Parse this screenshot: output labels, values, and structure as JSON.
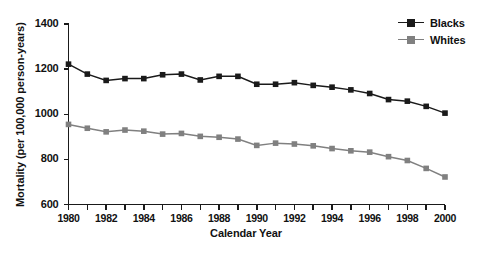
{
  "chart_data": {
    "type": "line",
    "title": "",
    "xlabel": "Calendar Year",
    "ylabel": "Mortality (per 100,000 person-years)",
    "x": [
      1980,
      1981,
      1982,
      1983,
      1984,
      1985,
      1986,
      1987,
      1988,
      1989,
      1990,
      1991,
      1992,
      1993,
      1994,
      1995,
      1996,
      1997,
      1998,
      1999,
      2000
    ],
    "xlim": [
      1980,
      2000
    ],
    "ylim": [
      600,
      1400
    ],
    "yticks": [
      600,
      800,
      1000,
      1200,
      1400
    ],
    "xticks": [
      1980,
      1982,
      1984,
      1986,
      1988,
      1990,
      1992,
      1994,
      1996,
      1998,
      2000
    ],
    "grid": false,
    "legend_position": "top-right",
    "series": [
      {
        "name": "Blacks",
        "color": "#1a1a1a",
        "marker": "square",
        "values": [
          1222,
          1178,
          1150,
          1158,
          1158,
          1175,
          1178,
          1152,
          1168,
          1168,
          1133,
          1133,
          1140,
          1128,
          1120,
          1108,
          1092,
          1065,
          1058,
          1035,
          1005
        ]
      },
      {
        "name": "Whites",
        "color": "#808080",
        "marker": "square",
        "values": [
          955,
          938,
          922,
          930,
          925,
          912,
          915,
          902,
          898,
          890,
          862,
          872,
          868,
          860,
          848,
          838,
          832,
          812,
          795,
          760,
          722
        ]
      }
    ]
  },
  "legend": {
    "items": [
      {
        "label": "Blacks",
        "color": "#1a1a1a"
      },
      {
        "label": "Whites",
        "color": "#808080"
      }
    ]
  },
  "axes": {
    "y_title": "Mortality (per 100,000 person-years)",
    "x_title": "Calendar Year",
    "y_tick_labels": [
      "1400",
      "1200",
      "1000",
      "800",
      "600"
    ],
    "x_tick_labels": [
      "1980",
      "1982",
      "1984",
      "1986",
      "1988",
      "1990",
      "1992",
      "1994",
      "1996",
      "1998",
      "2000"
    ]
  }
}
